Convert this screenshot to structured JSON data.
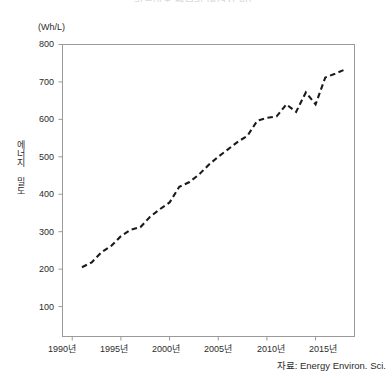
{
  "figure": {
    "title": "리튬이온 배터리 에너지 밀도",
    "unit_label": "(Wh/L)",
    "ylabel": "에너지 밀도",
    "source_note": "자료: Energy Environ. Sci."
  },
  "chart_data": {
    "type": "line",
    "title": "리튬이온 배터리 에너지 밀도",
    "xlabel": "",
    "ylabel": "에너지 밀도",
    "unit": "Wh/L",
    "source": "자료: Energy Environ. Sci.",
    "grid": false,
    "legend": null,
    "line_style": "dashed",
    "line_color": "#1a1a1a",
    "xlim": [
      1989,
      2019
    ],
    "ylim": [
      20,
      800
    ],
    "xticks": [
      1990,
      1995,
      2000,
      2005,
      2010,
      2015
    ],
    "xticklabels": [
      "1990년",
      "1995년",
      "2000년",
      "2005년",
      "2010년",
      "2015년"
    ],
    "yticks": [
      100,
      200,
      300,
      400,
      500,
      600,
      700,
      800
    ],
    "yticklabels": [
      "100",
      "200",
      "300",
      "400",
      "500",
      "600",
      "700",
      "800"
    ],
    "series": [
      {
        "name": "에너지 밀도",
        "x": [
          1991,
          1992,
          1993,
          1994,
          1995,
          1996,
          1997,
          1998,
          1999,
          2000,
          2001,
          2002,
          2003,
          2004,
          2005,
          2006,
          2007,
          2008,
          2009,
          2010,
          2011,
          2012,
          2013,
          2014,
          2015,
          2016,
          2017,
          2018
        ],
        "values": [
          205,
          218,
          245,
          262,
          288,
          305,
          312,
          340,
          360,
          378,
          420,
          432,
          452,
          478,
          500,
          520,
          540,
          556,
          596,
          604,
          608,
          640,
          620,
          672,
          640,
          712,
          722,
          733
        ]
      }
    ]
  },
  "yticks": [
    {
      "label": "800",
      "top": 39
    },
    {
      "label": "700",
      "top": 77
    },
    {
      "label": "600",
      "top": 114
    },
    {
      "label": "500",
      "top": 152
    },
    {
      "label": "400",
      "top": 189
    },
    {
      "label": "300",
      "top": 227
    },
    {
      "label": "200",
      "top": 264
    },
    {
      "label": "100",
      "top": 302
    }
  ],
  "xticks": [
    {
      "label": "1990년",
      "left": 40
    },
    {
      "label": "1995년",
      "left": 92
    },
    {
      "label": "2000년",
      "left": 144
    },
    {
      "label": "2005년",
      "left": 196
    },
    {
      "label": "2010년",
      "left": 249
    },
    {
      "label": "2015년",
      "left": 301
    }
  ]
}
